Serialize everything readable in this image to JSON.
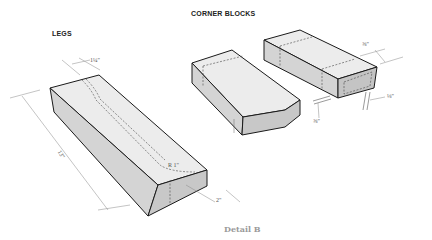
{
  "titles": {
    "legs": "LEGS",
    "corner_blocks": "CORNER BLOCKS"
  },
  "caption": "Detail B",
  "dimensions": {
    "leg_thickness": "1¼\"",
    "leg_length": "13\"",
    "leg_width": "2\"",
    "leg_radius": "R 1\"",
    "block_thickness": "⅝\"",
    "block_recess": "⅛\"",
    "block_offset": "⅝\""
  },
  "colors": {
    "top_face": "#ececec",
    "side_face": "#d4d4d4",
    "end_face": "#c4c4c4",
    "outline": "#1a1a1a",
    "caption": "#9a9a9a"
  }
}
